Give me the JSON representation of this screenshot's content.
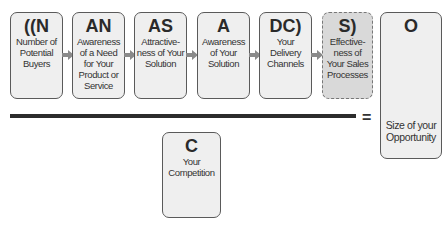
{
  "numerator_factors": [
    {
      "symbol": "((N",
      "label": "Number of Potential Buyers"
    },
    {
      "symbol": "AN",
      "label": "Awareness of a Need for Your Product or Service"
    },
    {
      "symbol": "AS",
      "label": "Attractive-ness of Your Solution"
    },
    {
      "symbol": "A",
      "label": "Awareness of Your Solution"
    },
    {
      "symbol": "DC)",
      "label": "Your Delivery Channels"
    },
    {
      "symbol": "S)",
      "label": "Effective-ness of Your Sales Processes"
    }
  ],
  "denominator": {
    "symbol": "C",
    "label": "Your Competition"
  },
  "equals_sign": "=",
  "result": {
    "symbol": "O",
    "label": "Size of your Opportunity"
  },
  "colors": {
    "box_fill": "#efefef",
    "highlight_fill": "#d9d9d9",
    "arrow": "#8a8a8a",
    "line": "#2c2c2c"
  }
}
